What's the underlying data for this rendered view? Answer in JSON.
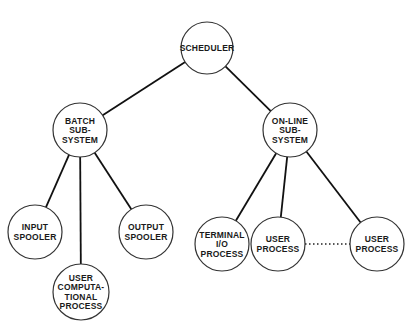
{
  "diagram": {
    "colors": {
      "stroke": "#333333",
      "edge": "#111111",
      "background": "#ffffff"
    },
    "nodes": [
      {
        "id": "scheduler",
        "cx": 207,
        "cy": 48,
        "r": 26,
        "lines": [
          "SCHEDULER"
        ]
      },
      {
        "id": "batch",
        "cx": 80,
        "cy": 130,
        "r": 27,
        "lines": [
          "BATCH",
          "SUB-",
          "SYSTEM"
        ]
      },
      {
        "id": "online",
        "cx": 290,
        "cy": 130,
        "r": 27,
        "lines": [
          "ON-LINE",
          "SUB-",
          "SYSTEM"
        ]
      },
      {
        "id": "input",
        "cx": 35,
        "cy": 232,
        "r": 27,
        "lines": [
          "INPUT",
          "SPOOLER"
        ]
      },
      {
        "id": "output",
        "cx": 146,
        "cy": 232,
        "r": 27,
        "lines": [
          "OUTPUT",
          "SPOOLER"
        ]
      },
      {
        "id": "usercomp",
        "cx": 81,
        "cy": 292,
        "r": 28,
        "lines": [
          "USER",
          "COMPUTA-",
          "TIONAL",
          "PROCESS"
        ]
      },
      {
        "id": "terminal",
        "cx": 222,
        "cy": 244,
        "r": 27,
        "lines": [
          "TERMINAL",
          "I/O",
          "PROCESS"
        ]
      },
      {
        "id": "user1",
        "cx": 278,
        "cy": 244,
        "r": 27,
        "lines": [
          "USER",
          "PROCESS"
        ]
      },
      {
        "id": "user2",
        "cx": 377,
        "cy": 244,
        "r": 27,
        "lines": [
          "USER",
          "PROCESS"
        ]
      }
    ],
    "edges": [
      {
        "from": "scheduler",
        "to": "batch",
        "style": "solid"
      },
      {
        "from": "scheduler",
        "to": "online",
        "style": "solid"
      },
      {
        "from": "batch",
        "to": "input",
        "style": "solid"
      },
      {
        "from": "batch",
        "to": "usercomp",
        "style": "solid"
      },
      {
        "from": "batch",
        "to": "output",
        "style": "solid"
      },
      {
        "from": "online",
        "to": "terminal",
        "style": "solid"
      },
      {
        "from": "online",
        "to": "user1",
        "style": "solid"
      },
      {
        "from": "online",
        "to": "user2",
        "style": "solid"
      },
      {
        "from": "user1",
        "to": "user2",
        "style": "dotted"
      }
    ]
  }
}
